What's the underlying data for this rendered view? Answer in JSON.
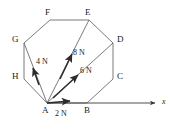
{
  "figure": {
    "type": "free-body-force-diagram",
    "background_color": "#ffffff",
    "stroke_color": "#555555",
    "text_color": "#1a1a1a"
  },
  "polygon": {
    "name": "octagon",
    "vertex_labels": [
      "A",
      "B",
      "C",
      "D",
      "E",
      "F",
      "G",
      "H"
    ],
    "vertices": [
      {
        "label": "A",
        "x": 47,
        "y": 103,
        "label_x": 43,
        "label_y": 107
      },
      {
        "label": "B",
        "x": 87,
        "y": 103,
        "label_x": 85,
        "label_y": 107
      },
      {
        "label": "C",
        "x": 113,
        "y": 79,
        "label_x": 117,
        "label_y": 73
      },
      {
        "label": "D",
        "x": 113,
        "y": 43,
        "label_x": 117,
        "label_y": 36
      },
      {
        "label": "E",
        "x": 89,
        "y": 20,
        "label_x": 85,
        "label_y": 10
      },
      {
        "label": "F",
        "x": 50,
        "y": 20,
        "label_x": 45,
        "label_y": 10
      },
      {
        "label": "G",
        "x": 24,
        "y": 43,
        "label_x": 13,
        "label_y": 36
      },
      {
        "label": "H",
        "x": 24,
        "y": 79,
        "label_x": 13,
        "label_y": 73
      }
    ]
  },
  "diagonals": [
    {
      "name": "A-G",
      "from": "A",
      "to": "G"
    },
    {
      "name": "A-E",
      "from": "A",
      "to": "E"
    },
    {
      "name": "A-D",
      "from": "A",
      "to": "D"
    }
  ],
  "forces": [
    {
      "name": "force-2N",
      "magnitude": "2 N",
      "label": "2 N",
      "label_x": 55,
      "label_y": 110,
      "from": {
        "x": 47,
        "y": 103
      },
      "to": {
        "x": 73,
        "y": 101
      },
      "direction": "along A to B (horizontal right)"
    },
    {
      "name": "force-6N",
      "magnitude": "6 N",
      "label": "6 N",
      "label_x": 81,
      "label_y": 67,
      "from": {
        "x": 47,
        "y": 103
      },
      "to": {
        "x": 80,
        "y": 73
      },
      "direction": "along A to D"
    },
    {
      "name": "force-8N",
      "magnitude": "8 N",
      "label": "8 N",
      "label_x": 74,
      "label_y": 49,
      "from": {
        "x": 47,
        "y": 103
      },
      "to": {
        "x": 72,
        "y": 52
      },
      "direction": "along A to E"
    },
    {
      "name": "force-4N",
      "magnitude": "4 N",
      "label": "4 N",
      "label_x": 37,
      "label_y": 58,
      "from": {
        "x": 47,
        "y": 103
      },
      "to": {
        "x": 33,
        "y": 66
      },
      "direction": "along A to G"
    }
  ],
  "axis": {
    "name": "x-axis",
    "label": "x",
    "label_x": 162,
    "label_y": 99,
    "from": {
      "x": 47,
      "y": 103
    },
    "to": {
      "x": 157,
      "y": 103
    }
  }
}
